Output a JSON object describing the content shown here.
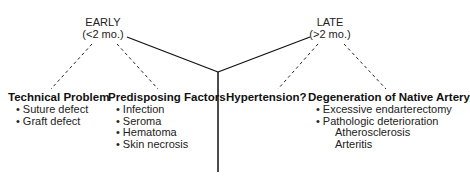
{
  "diagram": {
    "branches": [
      {
        "label": "EARLY",
        "sublabel": "(<2 mo.)",
        "categories": [
          {
            "title": "Technical Problem",
            "items": [
              "Suture defect",
              "Graft defect"
            ]
          },
          {
            "title": "Predisposing Factors",
            "items": [
              "Infection",
              "Seroma",
              "Hematoma",
              "Skin necrosis"
            ]
          }
        ]
      },
      {
        "label": "LATE",
        "sublabel": "(>2 mo.)",
        "categories": [
          {
            "title": "Hypertension?",
            "items": []
          },
          {
            "title": "Degeneration of Native Artery",
            "items": [
              "Excessive endarterectomy",
              "Pathologic deterioration"
            ],
            "subitems": [
              "Atherosclerosis",
              "Arteritis"
            ]
          }
        ]
      }
    ],
    "colors": {
      "line": "#111111",
      "text": "#222222",
      "background": "#ffffff"
    }
  }
}
